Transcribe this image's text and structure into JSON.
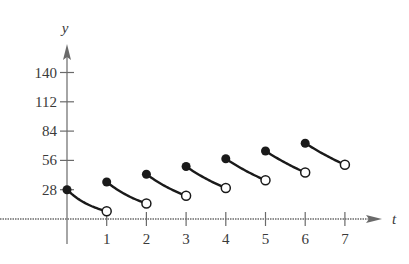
{
  "chart_data": {
    "type": "line",
    "title": "",
    "xlabel": "t",
    "ylabel": "y",
    "x_ticks": [
      1,
      2,
      3,
      4,
      5,
      6,
      7
    ],
    "y_ticks": [
      28,
      56,
      84,
      112,
      140
    ],
    "xlim": [
      0,
      7.5
    ],
    "ylim": [
      0,
      150
    ],
    "grid": false,
    "legend": null,
    "series": [
      {
        "name": "segments",
        "segments": [
          {
            "start": {
              "t": 0,
              "y": 28,
              "closed": true
            },
            "end": {
              "t": 1,
              "y": 7.4,
              "closed": false
            }
          },
          {
            "start": {
              "t": 1,
              "y": 35.4,
              "closed": true
            },
            "end": {
              "t": 2,
              "y": 14.8,
              "closed": false
            }
          },
          {
            "start": {
              "t": 2,
              "y": 42.8,
              "closed": true
            },
            "end": {
              "t": 3,
              "y": 22.2,
              "closed": false
            }
          },
          {
            "start": {
              "t": 3,
              "y": 50.2,
              "closed": true
            },
            "end": {
              "t": 4,
              "y": 29.6,
              "closed": false
            }
          },
          {
            "start": {
              "t": 4,
              "y": 57.6,
              "closed": true
            },
            "end": {
              "t": 5,
              "y": 37.0,
              "closed": false
            }
          },
          {
            "start": {
              "t": 5,
              "y": 65.0,
              "closed": true
            },
            "end": {
              "t": 6,
              "y": 44.4,
              "closed": false
            }
          },
          {
            "start": {
              "t": 6,
              "y": 72.4,
              "closed": true
            },
            "end": {
              "t": 7,
              "y": 51.8,
              "closed": false
            }
          }
        ]
      }
    ]
  },
  "labels": {
    "y_axis": "y",
    "x_axis": "t",
    "y_ticks": [
      "28",
      "56",
      "84",
      "112",
      "140"
    ],
    "x_ticks": [
      "1",
      "2",
      "3",
      "4",
      "5",
      "6",
      "7"
    ]
  }
}
